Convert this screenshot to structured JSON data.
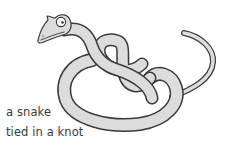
{
  "image": {
    "subject": "snake tied in a knot",
    "caption": {
      "line1": "a snake",
      "line2": "tied in a knot"
    },
    "colors": {
      "background": "#ffffff",
      "snake_fill": "#dcdcdc",
      "outline": "#3a3a3a",
      "text": "#3a3a3a",
      "eye": "#ffffff"
    }
  }
}
